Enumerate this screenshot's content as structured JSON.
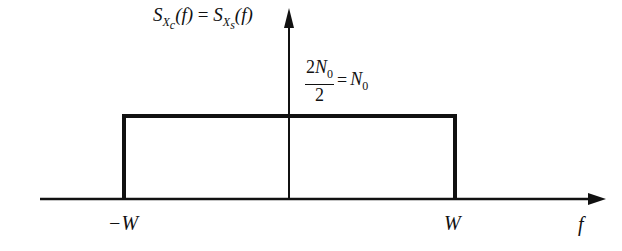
{
  "diagram": {
    "title": {
      "lhs_base": "S",
      "lhs_sub_main": "X",
      "lhs_sub_sub": "c",
      "rhs_base": "S",
      "rhs_sub_main": "X",
      "rhs_sub_sub": "s",
      "arg": "(f)",
      "eq": "="
    },
    "level_label": {
      "numerator": "2N",
      "numerator_sub": "0",
      "denominator": "2",
      "eq": "=",
      "rhs": "N",
      "rhs_sub": "0"
    },
    "x_ticks": {
      "left": "−W",
      "right": "W"
    },
    "x_axis_label": "f",
    "shape": "rectangle",
    "colors": {
      "line": "#111111",
      "background": "#ffffff"
    }
  }
}
